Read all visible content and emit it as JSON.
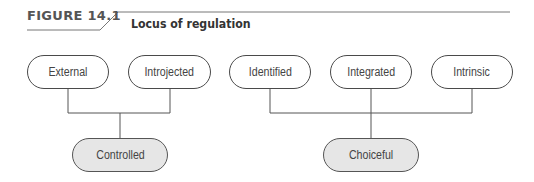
{
  "figure": {
    "label": "FIGURE 14.1",
    "title": "Locus of regulation"
  },
  "diagram": {
    "top_nodes": [
      {
        "id": "external",
        "label": "External"
      },
      {
        "id": "introjected",
        "label": "Introjected"
      },
      {
        "id": "identified",
        "label": "Identified"
      },
      {
        "id": "integrated",
        "label": "Integrated"
      },
      {
        "id": "intrinsic",
        "label": "Intrinsic"
      }
    ],
    "bottom_nodes": [
      {
        "id": "controlled",
        "label": "Controlled",
        "children": [
          "External",
          "Introjected"
        ]
      },
      {
        "id": "choiceful",
        "label": "Choiceful",
        "children": [
          "Identified",
          "Integrated",
          "Intrinsic"
        ]
      }
    ],
    "colors": {
      "line": "#555555",
      "result_fill": "#e6e6e6",
      "node_fill": "#ffffff"
    }
  }
}
